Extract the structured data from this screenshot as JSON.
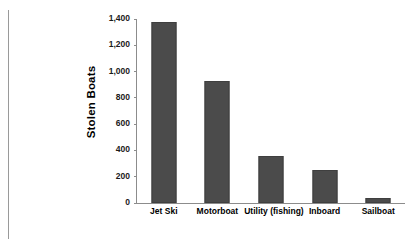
{
  "chart_data": {
    "type": "bar",
    "title": "",
    "subtitle": "",
    "xlabel": "",
    "ylabel": "Stolen Boats",
    "categories": [
      "Jet Ski",
      "Motorboat",
      "Utility (fishing)",
      "Inboard",
      "Sailboat"
    ],
    "values": [
      1375,
      930,
      360,
      250,
      40
    ],
    "series": [
      {
        "name": "Stolen Boats",
        "values": [
          1375,
          930,
          360,
          250,
          40
        ]
      }
    ],
    "ylim": [
      0,
      1400
    ],
    "ytick_step": 200,
    "ytick_labels": [
      "0",
      "200",
      "400",
      "600",
      "800",
      "1,000",
      "1,200",
      "1,400"
    ],
    "ytick_values": [
      0,
      200,
      400,
      600,
      800,
      1000,
      1200,
      1400
    ],
    "grid": false,
    "legend": false,
    "legend_position": "none",
    "annotations": [],
    "bar_color": "#4b4b4b",
    "axis_color": "#8c8c8c",
    "text_color": "#000000",
    "background_color": "#ffffff"
  },
  "artifacts": {
    "margin_rule_color": "#9a9a9a"
  }
}
